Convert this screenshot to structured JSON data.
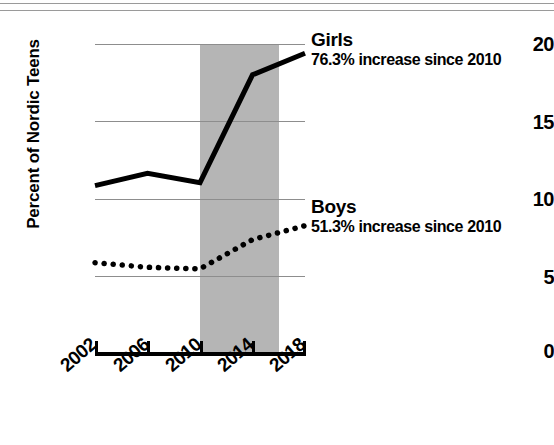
{
  "chart_data": {
    "type": "line",
    "title": "",
    "xlabel": "",
    "ylabel": "Percent of Nordic Teens",
    "x": [
      2002,
      2006,
      2010,
      2014,
      2018
    ],
    "xticklabels": [
      "2002",
      "2006",
      "2010",
      "2014",
      "2018"
    ],
    "yticklabels": [
      "0",
      "5",
      "10",
      "15",
      "20"
    ],
    "yticks": [
      0,
      5,
      10,
      15,
      20
    ],
    "ylim": [
      0,
      20
    ],
    "xlim": [
      2002,
      2018
    ],
    "grid": "horizontal",
    "legend_position": "inline-right-end-of-line",
    "series": [
      {
        "name": "Girls",
        "style": "solid",
        "color": "#000000",
        "values": [
          10.8,
          11.6,
          11.0,
          18.0,
          19.4
        ],
        "annotation": "76.3% increase since 2010"
      },
      {
        "name": "Boys",
        "style": "dotted",
        "color": "#000000",
        "values": [
          5.8,
          5.5,
          5.4,
          7.3,
          8.2
        ],
        "annotation": "51.3% increase since 2010"
      }
    ],
    "shaded_region": {
      "label": "",
      "x_start": 2010,
      "x_end": 2016,
      "color": "#b5b5b5"
    },
    "gridline_color": "#8d8d8d",
    "axis_color": "#000000"
  },
  "annotations": {
    "girls_label": "Girls",
    "girls_sub": "76.3% increase since 2010",
    "boys_label": "Boys",
    "boys_sub": "51.3% increase since 2010"
  },
  "axes": {
    "y_title": "Percent of Nordic Teens",
    "y_ticks": [
      "20",
      "15",
      "10",
      "5",
      "0"
    ],
    "x_ticks": [
      "2002",
      "2006",
      "2010",
      "2014",
      "2018"
    ]
  }
}
